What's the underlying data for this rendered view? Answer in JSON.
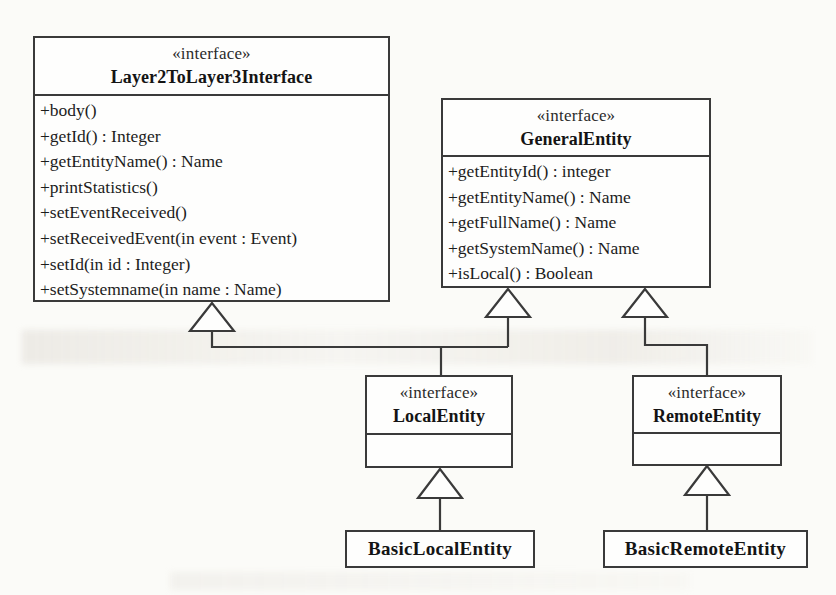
{
  "diagram": {
    "kind": "uml-class-diagram",
    "background_color": "#fbfbf8",
    "line_color": "#3a3a3a",
    "text_color": "#1c1c1c"
  },
  "classes": {
    "layer2_to_layer3": {
      "stereotype": "«interface»",
      "name": "Layer2ToLayer3Interface",
      "members": [
        "+body()",
        "+getId() : Integer",
        "+getEntityName() : Name",
        "+printStatistics()",
        "+setEventReceived()",
        "+setReceivedEvent(in event : Event)",
        "+setId(in id : Integer)",
        "+setSystemname(in name : Name)"
      ]
    },
    "general_entity": {
      "stereotype": "«interface»",
      "name": "GeneralEntity",
      "members": [
        "+getEntityId() : integer",
        "+getEntityName() : Name",
        "+getFullName() : Name",
        "+getSystemName() : Name",
        "+isLocal() : Boolean"
      ]
    },
    "local_entity": {
      "stereotype": "«interface»",
      "name": "LocalEntity",
      "members": []
    },
    "remote_entity": {
      "stereotype": "«interface»",
      "name": "RemoteEntity",
      "members": []
    },
    "basic_local_entity": {
      "name": "BasicLocalEntity"
    },
    "basic_remote_entity": {
      "name": "BasicRemoteEntity"
    }
  },
  "relationships": [
    {
      "type": "generalization",
      "from": "LocalEntity",
      "to": "Layer2ToLayer3Interface"
    },
    {
      "type": "generalization",
      "from": "LocalEntity",
      "to": "GeneralEntity"
    },
    {
      "type": "generalization",
      "from": "RemoteEntity",
      "to": "GeneralEntity"
    },
    {
      "type": "generalization",
      "from": "BasicLocalEntity",
      "to": "LocalEntity"
    },
    {
      "type": "generalization",
      "from": "BasicRemoteEntity",
      "to": "RemoteEntity"
    }
  ]
}
